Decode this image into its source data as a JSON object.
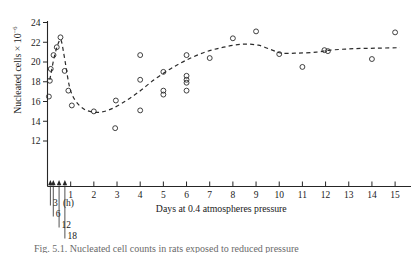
{
  "figure": {
    "caption": "Fig. 5.1. Nucleated cell counts in rats exposed to reduced pressure",
    "ylabel_main": "Nucleated cells × 10",
    "ylabel_exponent": "−6",
    "background": "#ffffff",
    "ink_color": "#2b2b2b"
  },
  "chart_data": {
    "type": "scatter",
    "title": "",
    "xlabel": "Days at 0.4 atmospheres pressure",
    "ylabel": "Nucleated cells × 10⁻⁶",
    "xlim": [
      0,
      15.6
    ],
    "ylim": [
      11.2,
      24.6
    ],
    "grid": false,
    "legend": null,
    "x_ticks": [
      1,
      2,
      3,
      4,
      5,
      6,
      7,
      8,
      9,
      10,
      11,
      12,
      13,
      14,
      15
    ],
    "x_tick_labels": [
      "1",
      "2",
      "3",
      "4",
      "5",
      "6",
      "7",
      "8",
      "9",
      "10",
      "11",
      "12",
      "13",
      "14",
      "15"
    ],
    "y_ticks": [
      12,
      14,
      16,
      18,
      20,
      22,
      24
    ],
    "y_tick_labels": [
      "12",
      "14",
      "16",
      "18",
      "20",
      "22",
      "24"
    ],
    "hour_markers": [
      {
        "label": "3",
        "suffix": "(h)",
        "x": 0.125
      },
      {
        "label": "6",
        "suffix": "",
        "x": 0.25
      },
      {
        "label": "12",
        "suffix": "",
        "x": 0.5
      },
      {
        "label": "18",
        "suffix": "",
        "x": 0.75
      }
    ],
    "points": [
      {
        "x": 0.06,
        "y": 16.5
      },
      {
        "x": 0.1,
        "y": 18.1
      },
      {
        "x": 0.14,
        "y": 19.3
      },
      {
        "x": 0.26,
        "y": 20.7
      },
      {
        "x": 0.4,
        "y": 21.5
      },
      {
        "x": 0.56,
        "y": 22.5
      },
      {
        "x": 0.74,
        "y": 19.1
      },
      {
        "x": 0.9,
        "y": 17.1
      },
      {
        "x": 1.05,
        "y": 15.6
      },
      {
        "x": 2.0,
        "y": 15.0
      },
      {
        "x": 2.95,
        "y": 16.1
      },
      {
        "x": 2.92,
        "y": 13.3
      },
      {
        "x": 4.0,
        "y": 20.7
      },
      {
        "x": 4.0,
        "y": 18.2
      },
      {
        "x": 4.0,
        "y": 15.1
      },
      {
        "x": 5.0,
        "y": 19.0
      },
      {
        "x": 5.0,
        "y": 17.1
      },
      {
        "x": 5.0,
        "y": 16.7
      },
      {
        "x": 6.0,
        "y": 20.7
      },
      {
        "x": 6.0,
        "y": 18.6
      },
      {
        "x": 6.0,
        "y": 18.2
      },
      {
        "x": 6.0,
        "y": 17.9
      },
      {
        "x": 6.0,
        "y": 17.1
      },
      {
        "x": 7.0,
        "y": 20.4
      },
      {
        "x": 8.0,
        "y": 22.4
      },
      {
        "x": 9.0,
        "y": 23.1
      },
      {
        "x": 10.0,
        "y": 20.8
      },
      {
        "x": 11.0,
        "y": 19.5
      },
      {
        "x": 11.95,
        "y": 21.2
      },
      {
        "x": 12.1,
        "y": 21.1
      },
      {
        "x": 14.0,
        "y": 20.3
      },
      {
        "x": 15.0,
        "y": 23.0
      }
    ],
    "trend_curve": [
      {
        "x": 0.1,
        "y": 18.2
      },
      {
        "x": 0.3,
        "y": 20.6
      },
      {
        "x": 0.5,
        "y": 22.1
      },
      {
        "x": 0.6,
        "y": 22.1
      },
      {
        "x": 0.75,
        "y": 20.2
      },
      {
        "x": 0.95,
        "y": 17.5
      },
      {
        "x": 1.2,
        "y": 16.1
      },
      {
        "x": 1.6,
        "y": 15.2
      },
      {
        "x": 2.1,
        "y": 14.9
      },
      {
        "x": 2.6,
        "y": 15.1
      },
      {
        "x": 3.2,
        "y": 15.8
      },
      {
        "x": 3.9,
        "y": 16.9
      },
      {
        "x": 4.6,
        "y": 18.2
      },
      {
        "x": 5.3,
        "y": 19.3
      },
      {
        "x": 6.0,
        "y": 20.2
      },
      {
        "x": 6.8,
        "y": 21.0
      },
      {
        "x": 7.6,
        "y": 21.5
      },
      {
        "x": 8.4,
        "y": 21.8
      },
      {
        "x": 9.1,
        "y": 21.7
      },
      {
        "x": 9.7,
        "y": 21.2
      },
      {
        "x": 10.1,
        "y": 20.9
      },
      {
        "x": 10.8,
        "y": 20.9
      },
      {
        "x": 11.6,
        "y": 21.0
      },
      {
        "x": 12.2,
        "y": 21.2
      },
      {
        "x": 13.2,
        "y": 21.35
      },
      {
        "x": 14.2,
        "y": 21.4
      },
      {
        "x": 15.2,
        "y": 21.45
      }
    ]
  }
}
